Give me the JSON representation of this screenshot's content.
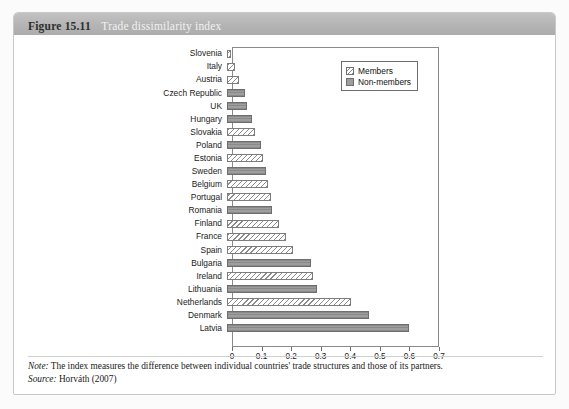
{
  "figure": {
    "number": "Figure 15.11",
    "title": "Trade dissimilarity index"
  },
  "legend": {
    "position": "top-right",
    "items": [
      {
        "label": "Members",
        "swatch": "members-hatched-swatch"
      },
      {
        "label": "Non-members",
        "swatch": "nonmembers-gray-swatch"
      }
    ]
  },
  "footnotes": {
    "note_lead": "Note:",
    "note_text": " The index measures the difference between individual countries' trade structures and those of its partners.",
    "source_lead": "Source:",
    "source_text": " Horváth (2007)"
  },
  "chart_data": {
    "type": "bar",
    "orientation": "horizontal",
    "title": "Trade dissimilarity index",
    "xlabel": "",
    "ylabel": "",
    "xlim": [
      0,
      0.7
    ],
    "xticks": [
      "0",
      "0.1",
      "0.2",
      "0.3",
      "0.4",
      "0.5",
      "0.6",
      "0.7"
    ],
    "xtick_values": [
      0,
      0.1,
      0.2,
      0.3,
      0.4,
      0.5,
      0.6,
      0.7
    ],
    "grid": false,
    "legend_entries": [
      "Members",
      "Non-members"
    ],
    "categories": [
      "Slovenia",
      "Italy",
      "Austria",
      "Czech Republic",
      "UK",
      "Hungary",
      "Slovakia",
      "Poland",
      "Estonia",
      "Sweden",
      "Belgium",
      "Portugal",
      "Romania",
      "Finland",
      "France",
      "Spain",
      "Bulgaria",
      "Ireland",
      "Lithuania",
      "Netherlands",
      "Denmark",
      "Latvia"
    ],
    "values": [
      0.013,
      0.028,
      0.042,
      0.062,
      0.068,
      0.085,
      0.093,
      0.115,
      0.122,
      0.133,
      0.14,
      0.148,
      0.152,
      0.175,
      0.198,
      0.222,
      0.283,
      0.292,
      0.305,
      0.42,
      0.48,
      0.615
    ],
    "groups": [
      "Members",
      "Members",
      "Members",
      "Non-members",
      "Non-members",
      "Non-members",
      "Members",
      "Non-members",
      "Members",
      "Non-members",
      "Members",
      "Members",
      "Non-members",
      "Members",
      "Members",
      "Members",
      "Non-members",
      "Members",
      "Non-members",
      "Members",
      "Non-members",
      "Non-members"
    ]
  }
}
